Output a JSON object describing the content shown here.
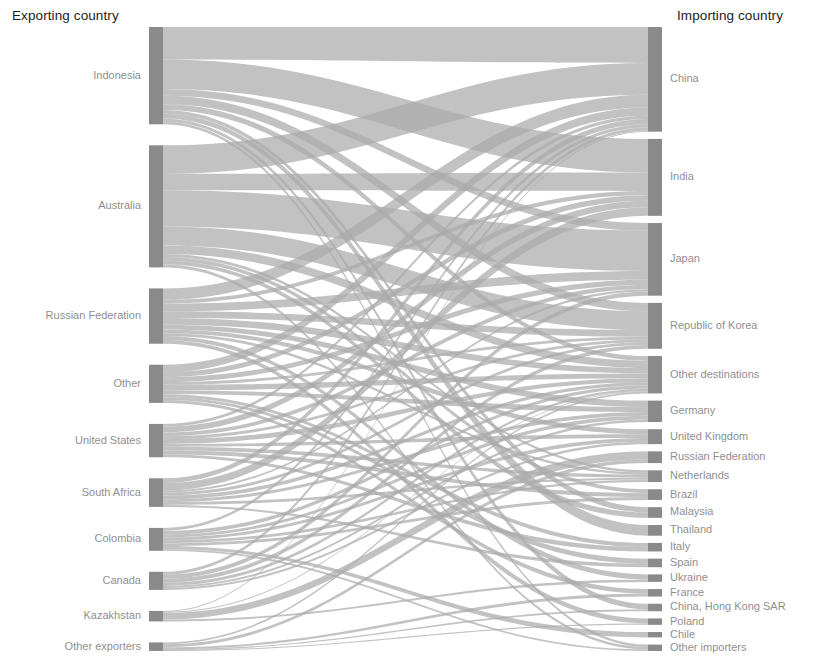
{
  "header": {
    "exporting_title": "Exporting country",
    "importing_title": "Importing country"
  },
  "style": {
    "node_color": "#8a8a8a",
    "link_color": "#aaaaaa",
    "background": "#ffffff",
    "title_color": "#1c1c1c",
    "label_color": "#8f8f8f"
  },
  "chart_data": {
    "type": "sankey",
    "title": "",
    "xlabel": "",
    "ylabel": "",
    "grid": false,
    "legend": "none",
    "left_axis_title": "Exporting country",
    "right_axis_title": "Importing country",
    "sources": [
      {
        "name": "Indonesia",
        "value": 102
      },
      {
        "name": "Australia",
        "value": 128
      },
      {
        "name": "Russian Federation",
        "value": 58
      },
      {
        "name": "Other",
        "value": 40
      },
      {
        "name": "United States",
        "value": 35
      },
      {
        "name": "South Africa",
        "value": 30
      },
      {
        "name": "Colombia",
        "value": 24
      },
      {
        "name": "Canada",
        "value": 19
      },
      {
        "name": "Kazakhstan",
        "value": 11
      },
      {
        "name": "Other exporters",
        "value": 9
      }
    ],
    "targets": [
      {
        "name": "China",
        "value": 98
      },
      {
        "name": "India",
        "value": 72
      },
      {
        "name": "Japan",
        "value": 68
      },
      {
        "name": "Republic of Korea",
        "value": 43
      },
      {
        "name": "Other destinations",
        "value": 35
      },
      {
        "name": "Germany",
        "value": 20
      },
      {
        "name": "United Kingdom",
        "value": 14
      },
      {
        "name": "Russian Federation",
        "value": 11
      },
      {
        "name": "Netherlands",
        "value": 11
      },
      {
        "name": "Brazil",
        "value": 10
      },
      {
        "name": "Malaysia",
        "value": 10
      },
      {
        "name": "Thailand",
        "value": 10
      },
      {
        "name": "Italy",
        "value": 8
      },
      {
        "name": "Spain",
        "value": 8
      },
      {
        "name": "Ukraine",
        "value": 7
      },
      {
        "name": "France",
        "value": 7
      },
      {
        "name": "China, Hong Kong SAR",
        "value": 7
      },
      {
        "name": "Poland",
        "value": 6
      },
      {
        "name": "Chile",
        "value": 5
      },
      {
        "name": "Other importers",
        "value": 6
      }
    ],
    "links": [
      {
        "source": "Indonesia",
        "target": "China",
        "value": 34
      },
      {
        "source": "Indonesia",
        "target": "India",
        "value": 31
      },
      {
        "source": "Indonesia",
        "target": "Japan",
        "value": 7
      },
      {
        "source": "Indonesia",
        "target": "Republic of Korea",
        "value": 9
      },
      {
        "source": "Indonesia",
        "target": "Other destinations",
        "value": 6
      },
      {
        "source": "Indonesia",
        "target": "Malaysia",
        "value": 4
      },
      {
        "source": "Indonesia",
        "target": "Thailand",
        "value": 5
      },
      {
        "source": "Indonesia",
        "target": "China, Hong Kong SAR",
        "value": 3
      },
      {
        "source": "Indonesia",
        "target": "Other importers",
        "value": 3
      },
      {
        "source": "Australia",
        "target": "China",
        "value": 30
      },
      {
        "source": "Australia",
        "target": "Japan",
        "value": 38
      },
      {
        "source": "Australia",
        "target": "Republic of Korea",
        "value": 20
      },
      {
        "source": "Australia",
        "target": "India",
        "value": 17
      },
      {
        "source": "Australia",
        "target": "Other destinations",
        "value": 9
      },
      {
        "source": "Australia",
        "target": "Malaysia",
        "value": 4
      },
      {
        "source": "Australia",
        "target": "Brazil",
        "value": 4
      },
      {
        "source": "Australia",
        "target": "Netherlands",
        "value": 3
      },
      {
        "source": "Australia",
        "target": "Other importers",
        "value": 3
      },
      {
        "source": "Russian Federation",
        "target": "China",
        "value": 12
      },
      {
        "source": "Russian Federation",
        "target": "Republic of Korea",
        "value": 7
      },
      {
        "source": "Russian Federation",
        "target": "Japan",
        "value": 8
      },
      {
        "source": "Russian Federation",
        "target": "Other destinations",
        "value": 7
      },
      {
        "source": "Russian Federation",
        "target": "Germany",
        "value": 5
      },
      {
        "source": "Russian Federation",
        "target": "Ukraine",
        "value": 4
      },
      {
        "source": "Russian Federation",
        "target": "Poland",
        "value": 4
      },
      {
        "source": "Russian Federation",
        "target": "United Kingdom",
        "value": 4
      },
      {
        "source": "Russian Federation",
        "target": "Netherlands",
        "value": 3
      },
      {
        "source": "Russian Federation",
        "target": "India",
        "value": 4
      },
      {
        "source": "Other",
        "target": "China",
        "value": 8
      },
      {
        "source": "Other",
        "target": "Other destinations",
        "value": 6
      },
      {
        "source": "Other",
        "target": "India",
        "value": 5
      },
      {
        "source": "Other",
        "target": "Japan",
        "value": 5
      },
      {
        "source": "Other",
        "target": "Germany",
        "value": 4
      },
      {
        "source": "Other",
        "target": "Republic of Korea",
        "value": 3
      },
      {
        "source": "Other",
        "target": "Italy",
        "value": 3
      },
      {
        "source": "Other",
        "target": "Spain",
        "value": 3
      },
      {
        "source": "Other",
        "target": "France",
        "value": 3
      },
      {
        "source": "United States",
        "target": "Other destinations",
        "value": 5
      },
      {
        "source": "United States",
        "target": "India",
        "value": 6
      },
      {
        "source": "United States",
        "target": "Netherlands",
        "value": 4
      },
      {
        "source": "United States",
        "target": "Brazil",
        "value": 4
      },
      {
        "source": "United States",
        "target": "Japan",
        "value": 4
      },
      {
        "source": "United States",
        "target": "Republic of Korea",
        "value": 3
      },
      {
        "source": "United States",
        "target": "United Kingdom",
        "value": 3
      },
      {
        "source": "United States",
        "target": "China",
        "value": 3
      },
      {
        "source": "United States",
        "target": "Italy",
        "value": 3
      },
      {
        "source": "South Africa",
        "target": "India",
        "value": 8
      },
      {
        "source": "South Africa",
        "target": "China",
        "value": 5
      },
      {
        "source": "South Africa",
        "target": "Republic of Korea",
        "value": 3
      },
      {
        "source": "South Africa",
        "target": "Other destinations",
        "value": 4
      },
      {
        "source": "South Africa",
        "target": "Germany",
        "value": 3
      },
      {
        "source": "South Africa",
        "target": "Netherlands",
        "value": 3
      },
      {
        "source": "South Africa",
        "target": "Spain",
        "value": 2
      },
      {
        "source": "South Africa",
        "target": "Japan",
        "value": 2
      },
      {
        "source": "Colombia",
        "target": "Other destinations",
        "value": 4
      },
      {
        "source": "Colombia",
        "target": "Netherlands",
        "value": 3
      },
      {
        "source": "Colombia",
        "target": "Chile",
        "value": 3
      },
      {
        "source": "Colombia",
        "target": "Germany",
        "value": 3
      },
      {
        "source": "Colombia",
        "target": "Brazil",
        "value": 3
      },
      {
        "source": "Colombia",
        "target": "United Kingdom",
        "value": 3
      },
      {
        "source": "Colombia",
        "target": "China",
        "value": 3
      },
      {
        "source": "Colombia",
        "target": "Other importers",
        "value": 2
      },
      {
        "source": "Canada",
        "target": "Republic of Korea",
        "value": 4
      },
      {
        "source": "Canada",
        "target": "Japan",
        "value": 4
      },
      {
        "source": "Canada",
        "target": "China",
        "value": 3
      },
      {
        "source": "Canada",
        "target": "Other destinations",
        "value": 3
      },
      {
        "source": "Canada",
        "target": "Germany",
        "value": 2
      },
      {
        "source": "Canada",
        "target": "United Kingdom",
        "value": 2
      },
      {
        "source": "Kazakhstan",
        "target": "Russian Federation",
        "value": 7
      },
      {
        "source": "Kazakhstan",
        "target": "Ukraine",
        "value": 2
      },
      {
        "source": "Kazakhstan",
        "target": "Other destinations",
        "value": 1
      },
      {
        "source": "Kazakhstan",
        "target": "China",
        "value": 1
      },
      {
        "source": "Other exporters",
        "target": "Russian Federation",
        "value": 3
      },
      {
        "source": "Other exporters",
        "target": "Other destinations",
        "value": 2
      },
      {
        "source": "Other exporters",
        "target": "France",
        "value": 2
      },
      {
        "source": "Other exporters",
        "target": "China, Hong Kong SAR",
        "value": 1
      },
      {
        "source": "Other exporters",
        "target": "Poland",
        "value": 1
      }
    ]
  }
}
